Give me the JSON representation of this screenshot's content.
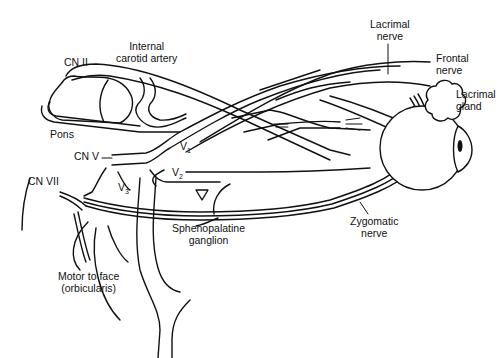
{
  "diagram": {
    "labels": {
      "cn_ii": "CN II",
      "internal_carotid_line1": "Internal",
      "internal_carotid_line2": "carotid artery",
      "pons": "Pons",
      "cn_v": "CN V",
      "cn_vii": "CN VII",
      "v1": "V",
      "v1_sub": "1",
      "v2": "V",
      "v2_sub": "2",
      "v3": "V",
      "v3_sub": "3",
      "sphenopalatine_line1": "Sphenopalatine",
      "sphenopalatine_line2": "ganglion",
      "motor_line1": "Motor to face",
      "motor_line2": "(orbicularis)",
      "lacrimal_nerve_line1": "Lacrimal",
      "lacrimal_nerve_line2": "nerve",
      "frontal_nerve_line1": "Frontal",
      "frontal_nerve_line2": "nerve",
      "lacrimal_gland_line1": "Lacrimal",
      "lacrimal_gland_line2": "gland",
      "zygomatic_line1": "Zygomatic",
      "zygomatic_line2": "nerve"
    },
    "colors": {
      "line": "#111111",
      "background": "#ffffff"
    }
  }
}
